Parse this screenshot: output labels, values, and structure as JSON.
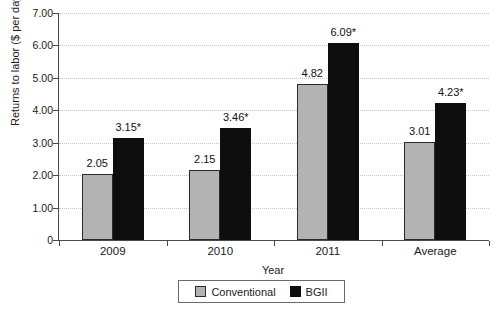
{
  "chart_data": {
    "type": "bar",
    "categories": [
      "2009",
      "2010",
      "2011",
      "Average"
    ],
    "series": [
      {
        "name": "Conventional",
        "color": "#b3b3b3",
        "border_color": "#2b2b2b",
        "values": [
          2.05,
          2.15,
          4.82,
          3.01
        ],
        "value_labels": [
          "2.05",
          "2.15",
          "4.82",
          "3.01"
        ]
      },
      {
        "name": "BGII",
        "color": "#0e0e0e",
        "border_color": "#0e0e0e",
        "values": [
          3.15,
          3.46,
          6.09,
          4.23
        ],
        "value_labels": [
          "3.15*",
          "3.46*",
          "6.09*",
          "4.23*"
        ]
      }
    ],
    "xlabel": "Year",
    "ylabel": "Returns to labor ($ per day)",
    "ylim": [
      0,
      7
    ],
    "ytick_step": 1,
    "ytick_labels": [
      "0",
      "1.00",
      "2.00",
      "3.00",
      "4.00",
      "5.00",
      "6.00",
      "7.00"
    ],
    "grid": "horizontal-dotted",
    "legend_position": "bottom-center",
    "axis_color": "#4a4a4a",
    "gridline_color": "#c8c8c8"
  }
}
